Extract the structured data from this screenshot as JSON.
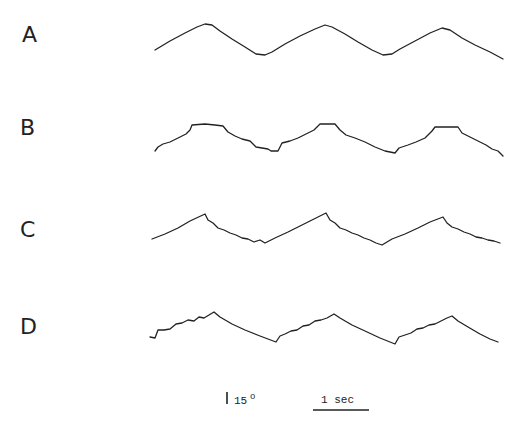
{
  "chart_data": {
    "type": "line",
    "title": "",
    "xlabel": "",
    "ylabel": "",
    "grid": false,
    "legend": null,
    "units": {
      "x": "sec",
      "y": "degrees"
    },
    "scale_bars": {
      "vertical": {
        "label": "15",
        "unit_symbol": "o",
        "value_deg": 15
      },
      "horizontal": {
        "label": "1 sec",
        "value_sec": 1
      }
    },
    "series": [
      {
        "name": "A",
        "description": "smooth sinusoidal-like tracking trace, 3 cycles",
        "points": [
          [
            155,
            50
          ],
          [
            170,
            41
          ],
          [
            185,
            33
          ],
          [
            197,
            27
          ],
          [
            205,
            24
          ],
          [
            212,
            25
          ],
          [
            220,
            31
          ],
          [
            232,
            39
          ],
          [
            245,
            47
          ],
          [
            256,
            54
          ],
          [
            265,
            55
          ],
          [
            272,
            52
          ],
          [
            285,
            44
          ],
          [
            300,
            36
          ],
          [
            315,
            29
          ],
          [
            325,
            25
          ],
          [
            332,
            27
          ],
          [
            345,
            34
          ],
          [
            358,
            42
          ],
          [
            372,
            50
          ],
          [
            383,
            55
          ],
          [
            392,
            54
          ],
          [
            400,
            49
          ],
          [
            415,
            41
          ],
          [
            430,
            33
          ],
          [
            442,
            28
          ],
          [
            450,
            30
          ],
          [
            462,
            38
          ],
          [
            475,
            45
          ],
          [
            490,
            52
          ],
          [
            503,
            59
          ]
        ]
      },
      {
        "name": "B",
        "description": "stepwise trace with flat plateaus at peaks and troughs",
        "points": [
          [
            155,
            151
          ],
          [
            158,
            147
          ],
          [
            163,
            144
          ],
          [
            170,
            142
          ],
          [
            178,
            138
          ],
          [
            186,
            134
          ],
          [
            190,
            130
          ],
          [
            192,
            125
          ],
          [
            205,
            124
          ],
          [
            215,
            125
          ],
          [
            223,
            126
          ],
          [
            228,
            132
          ],
          [
            235,
            136
          ],
          [
            242,
            139
          ],
          [
            250,
            141
          ],
          [
            256,
            147
          ],
          [
            262,
            148
          ],
          [
            268,
            149
          ],
          [
            271,
            151
          ],
          [
            278,
            151
          ],
          [
            282,
            143
          ],
          [
            290,
            141
          ],
          [
            298,
            138
          ],
          [
            306,
            134
          ],
          [
            314,
            130
          ],
          [
            320,
            124
          ],
          [
            335,
            124
          ],
          [
            340,
            130
          ],
          [
            346,
            135
          ],
          [
            355,
            138
          ],
          [
            365,
            142
          ],
          [
            375,
            147
          ],
          [
            385,
            151
          ],
          [
            395,
            153
          ],
          [
            399,
            148
          ],
          [
            408,
            145
          ],
          [
            416,
            142
          ],
          [
            425,
            138
          ],
          [
            432,
            131
          ],
          [
            435,
            127
          ],
          [
            458,
            127
          ],
          [
            462,
            133
          ],
          [
            470,
            137
          ],
          [
            478,
            141
          ],
          [
            486,
            145
          ],
          [
            492,
            149
          ],
          [
            498,
            151
          ],
          [
            503,
            156
          ]
        ]
      },
      {
        "name": "C",
        "description": "smooth ramp up, stepwise descent (sawtooth-like)",
        "points": [
          [
            152,
            239
          ],
          [
            165,
            234
          ],
          [
            178,
            228
          ],
          [
            190,
            221
          ],
          [
            205,
            214
          ],
          [
            208,
            220
          ],
          [
            213,
            223
          ],
          [
            218,
            228
          ],
          [
            224,
            230
          ],
          [
            230,
            233
          ],
          [
            236,
            235
          ],
          [
            242,
            238
          ],
          [
            248,
            239
          ],
          [
            254,
            242
          ],
          [
            260,
            240
          ],
          [
            265,
            243
          ],
          [
            275,
            238
          ],
          [
            288,
            232
          ],
          [
            300,
            226
          ],
          [
            312,
            220
          ],
          [
            326,
            213
          ],
          [
            330,
            220
          ],
          [
            335,
            223
          ],
          [
            340,
            228
          ],
          [
            346,
            230
          ],
          [
            352,
            233
          ],
          [
            358,
            235
          ],
          [
            364,
            238
          ],
          [
            370,
            240
          ],
          [
            376,
            243
          ],
          [
            382,
            245
          ],
          [
            392,
            239
          ],
          [
            405,
            234
          ],
          [
            418,
            228
          ],
          [
            430,
            222
          ],
          [
            443,
            217
          ],
          [
            447,
            223
          ],
          [
            452,
            227
          ],
          [
            458,
            229
          ],
          [
            464,
            232
          ],
          [
            470,
            234
          ],
          [
            476,
            237
          ],
          [
            482,
            238
          ],
          [
            488,
            240
          ],
          [
            494,
            241
          ],
          [
            500,
            243
          ]
        ]
      },
      {
        "name": "D",
        "description": "stepwise ramp up, smooth descent (inverse sawtooth)",
        "points": [
          [
            150,
            337
          ],
          [
            155,
            338
          ],
          [
            158,
            330
          ],
          [
            164,
            330
          ],
          [
            170,
            329
          ],
          [
            176,
            324
          ],
          [
            182,
            323
          ],
          [
            188,
            320
          ],
          [
            194,
            321
          ],
          [
            199,
            317
          ],
          [
            204,
            318
          ],
          [
            209,
            315
          ],
          [
            214,
            312
          ],
          [
            220,
            317
          ],
          [
            232,
            324
          ],
          [
            245,
            330
          ],
          [
            260,
            336
          ],
          [
            276,
            342
          ],
          [
            280,
            336
          ],
          [
            285,
            334
          ],
          [
            291,
            331
          ],
          [
            297,
            330
          ],
          [
            303,
            326
          ],
          [
            309,
            325
          ],
          [
            315,
            321
          ],
          [
            321,
            320
          ],
          [
            327,
            318
          ],
          [
            334,
            314
          ],
          [
            340,
            318
          ],
          [
            352,
            325
          ],
          [
            365,
            331
          ],
          [
            380,
            338
          ],
          [
            395,
            344
          ],
          [
            399,
            337
          ],
          [
            405,
            335
          ],
          [
            411,
            333
          ],
          [
            417,
            329
          ],
          [
            423,
            328
          ],
          [
            429,
            325
          ],
          [
            435,
            324
          ],
          [
            441,
            321
          ],
          [
            447,
            318
          ],
          [
            452,
            316
          ],
          [
            458,
            321
          ],
          [
            468,
            327
          ],
          [
            480,
            334
          ],
          [
            490,
            339
          ],
          [
            498,
            342
          ]
        ]
      }
    ]
  },
  "figure": {
    "panels": [
      {
        "id": "A",
        "label": "A"
      },
      {
        "id": "B",
        "label": "B"
      },
      {
        "id": "C",
        "label": "C"
      },
      {
        "id": "D",
        "label": "D"
      }
    ],
    "scale": {
      "amplitude_value": "15",
      "amplitude_unit": "o",
      "time_label": "1 sec"
    }
  }
}
